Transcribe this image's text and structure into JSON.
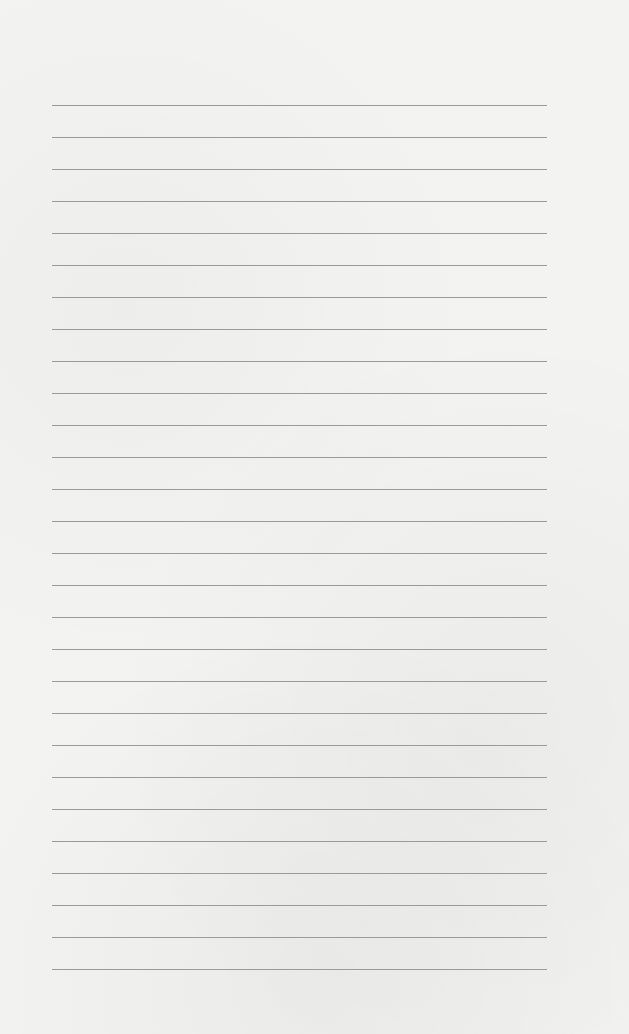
{
  "paper": {
    "type": "lined-paper",
    "background_color": "#f3f3f1",
    "line_color": "#9a9a9a",
    "line_count": 28,
    "first_line_y": 105,
    "line_spacing": 32,
    "line_left": 52,
    "line_right": 547
  }
}
